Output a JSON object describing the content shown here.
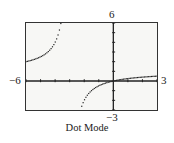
{
  "window": {
    "xmin_label": "−6",
    "xmax_label": "3",
    "ymax_label": "6",
    "ymin_label": "−3"
  },
  "caption": "Dot Mode",
  "chart_data": {
    "type": "scatter",
    "title": "",
    "caption": "Dot Mode",
    "function": "y = x/(x+3)",
    "mode": "dot",
    "xlabel": "",
    "ylabel": "",
    "xlim": [
      -6,
      3
    ],
    "ylim": [
      -3,
      6
    ],
    "xscale_ticks": [
      -6,
      -5,
      -4,
      -3,
      -2,
      -1,
      1,
      2,
      3
    ],
    "yscale_ticks": [
      -3,
      -2,
      -1,
      1,
      2,
      3,
      4,
      5,
      6
    ],
    "grid": false,
    "vertical_asymptote": -3,
    "series": [
      {
        "name": "left branch",
        "x": [
          -6,
          -5.6,
          -5.2,
          -4.8,
          -4.5,
          -4.2,
          -4.0,
          -3.85,
          -3.75,
          -3.67,
          -3.6
        ],
        "y": [
          2.0,
          2.15,
          2.36,
          2.67,
          3.0,
          3.5,
          4.0,
          4.53,
          5.0,
          5.48,
          6.0
        ]
      },
      {
        "name": "right branch",
        "x": [
          -2.2,
          -2.0,
          -1.8,
          -1.6,
          -1.4,
          -1.2,
          -1.0,
          -0.8,
          -0.6,
          -0.4,
          -0.2,
          0,
          0.5,
          1.0,
          1.5,
          2.0,
          2.5,
          3.0
        ],
        "y": [
          -2.75,
          -2.0,
          -1.5,
          -1.14,
          -0.88,
          -0.67,
          -0.5,
          -0.36,
          -0.25,
          -0.15,
          -0.07,
          0,
          0.14,
          0.25,
          0.33,
          0.4,
          0.45,
          0.5
        ]
      }
    ]
  }
}
